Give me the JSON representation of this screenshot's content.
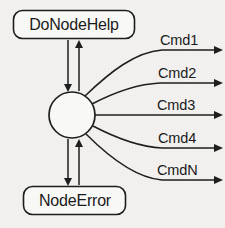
{
  "diagram": {
    "background_color": "#f4f3f1",
    "line_color": "#1f1f1f",
    "text_color": "#1b1b1b",
    "nodes": {
      "top_box": {
        "label": "DoNodeHelp",
        "shape": "rounded-rectangle",
        "x": 13,
        "y": 10,
        "width": 122,
        "height": 29
      },
      "bottom_box": {
        "label": "NodeError",
        "shape": "rounded-rectangle",
        "x": 23,
        "y": 186,
        "width": 103,
        "height": 29
      },
      "center_state": {
        "label": "",
        "shape": "circle",
        "cx": 72,
        "cy": 115,
        "r": 23
      }
    },
    "vertical_connectors": [
      {
        "name": "down-to-circle-top",
        "direction": "down",
        "x": 68,
        "from_y": 40,
        "to_y": 91
      },
      {
        "name": "up-to-dononodehelp",
        "direction": "up",
        "x": 79,
        "from_y": 91,
        "to_y": 40
      },
      {
        "name": "down-to-nodeerror",
        "direction": "down",
        "x": 68,
        "from_y": 139,
        "to_y": 185
      },
      {
        "name": "up-to-circle-bottom",
        "direction": "up",
        "x": 79,
        "from_y": 185,
        "to_y": 139
      }
    ],
    "commands": [
      {
        "label": "Cmd1",
        "label_x": 160,
        "label_y": 41,
        "arrow_y": 50,
        "origin_angle": -58
      },
      {
        "label": "Cmd2",
        "label_x": 158,
        "label_y": 74,
        "arrow_y": 83,
        "origin_angle": -33
      },
      {
        "label": "Cmd3",
        "label_x": 157,
        "label_y": 106,
        "arrow_y": 115,
        "origin_angle": 0
      },
      {
        "label": "Cmd4",
        "label_x": 158,
        "label_y": 139,
        "arrow_y": 148,
        "origin_angle": 30
      },
      {
        "label": "CmdN",
        "label_x": 157,
        "label_y": 171,
        "arrow_y": 180,
        "origin_angle": 55
      }
    ],
    "arrow_tip_x": 223
  }
}
